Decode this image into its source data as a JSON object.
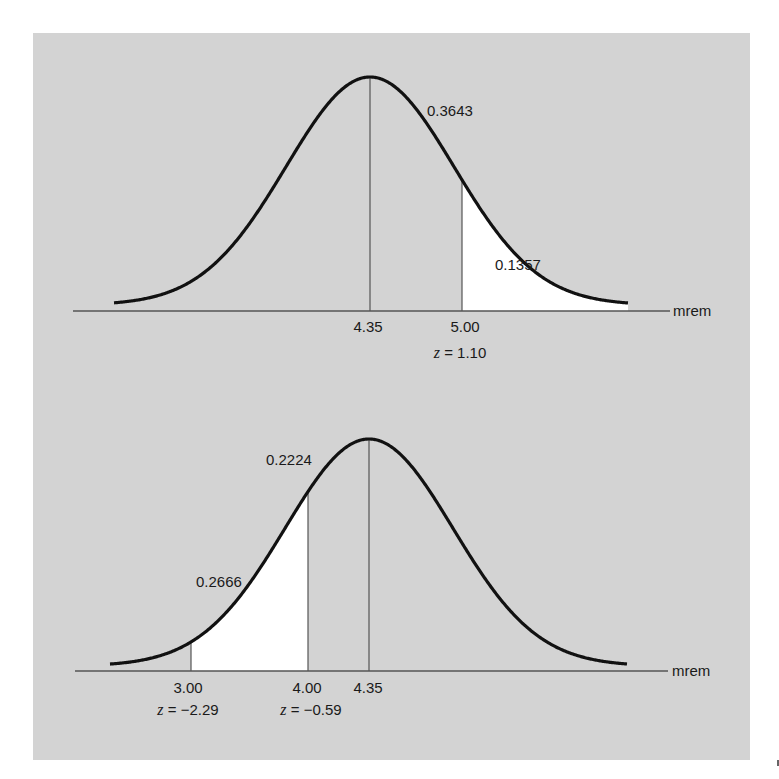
{
  "figure": {
    "background_color": "#d3d3d3",
    "curve_color": "#111111",
    "shade_color": "#ffffff",
    "axis_color": "#555555"
  },
  "chart_data": [
    {
      "type": "area",
      "title": "",
      "distribution": "normal",
      "mean": 4.35,
      "xlabel": "mrem",
      "ylabel": "",
      "grid": false,
      "legend": null,
      "markers": [
        {
          "x": 4.35,
          "label": "4.35",
          "z": null
        },
        {
          "x": 5.0,
          "label": "5.00",
          "z": "z = 1.10"
        }
      ],
      "shaded_region": {
        "from": 5.0,
        "to": "inf",
        "area": 0.1357,
        "label": "0.1357"
      },
      "annotations": [
        {
          "text": "0.3643",
          "region": "between 4.35 and 5.00"
        },
        {
          "text": "0.1357",
          "region": "above 5.00"
        }
      ],
      "layout": {
        "axis_y": 311,
        "axis_x0": 73,
        "axis_x1": 670,
        "peak_x": 370,
        "peak_y": 77,
        "base_y": 305,
        "sigma_px": 84,
        "curve_x0": 114,
        "curve_x1": 628,
        "mean_line_x": 370,
        "cut_lines_x": [
          462
        ],
        "shade_x0": 462,
        "shade_x1": 628
      }
    },
    {
      "type": "area",
      "title": "",
      "distribution": "normal",
      "mean": 4.35,
      "xlabel": "mrem",
      "ylabel": "",
      "grid": false,
      "legend": null,
      "markers": [
        {
          "x": 3.0,
          "label": "3.00",
          "z": "z = −2.29"
        },
        {
          "x": 4.0,
          "label": "4.00",
          "z": "z = −0.59"
        },
        {
          "x": 4.35,
          "label": "4.35",
          "z": null
        }
      ],
      "shaded_region": {
        "from": 3.0,
        "to": 4.0,
        "area": 0.2666,
        "label": "0.2666"
      },
      "annotations": [
        {
          "text": "0.2224",
          "region": "between 4.00 and 4.35"
        },
        {
          "text": "0.2666",
          "region": "between 3.00 and 4.00"
        }
      ],
      "layout": {
        "axis_y": 671,
        "axis_x0": 75,
        "axis_x1": 668,
        "peak_x": 369,
        "peak_y": 439,
        "base_y": 666,
        "sigma_px": 84,
        "curve_x0": 110,
        "curve_x1": 627,
        "mean_line_x": 369,
        "cut_lines_x": [
          191,
          308
        ],
        "shade_x0": 191,
        "shade_x1": 308
      }
    }
  ],
  "labels": {
    "top": {
      "area_center": "0.3643",
      "area_tail": "0.1357",
      "tick_mean": "4.35",
      "tick_cut": "5.00",
      "z_cut_var": "z",
      "z_cut_val": " = 1.10",
      "unit": "mrem"
    },
    "bottom": {
      "area_center": "0.2224",
      "area_shaded": "0.2666",
      "tick_low": "3.00",
      "tick_cut": "4.00",
      "tick_mean": "4.35",
      "z_low_var": "z",
      "z_low_val": " = −2.29",
      "z_cut_var": "z",
      "z_cut_val": " = −0.59",
      "unit": "mrem"
    }
  }
}
